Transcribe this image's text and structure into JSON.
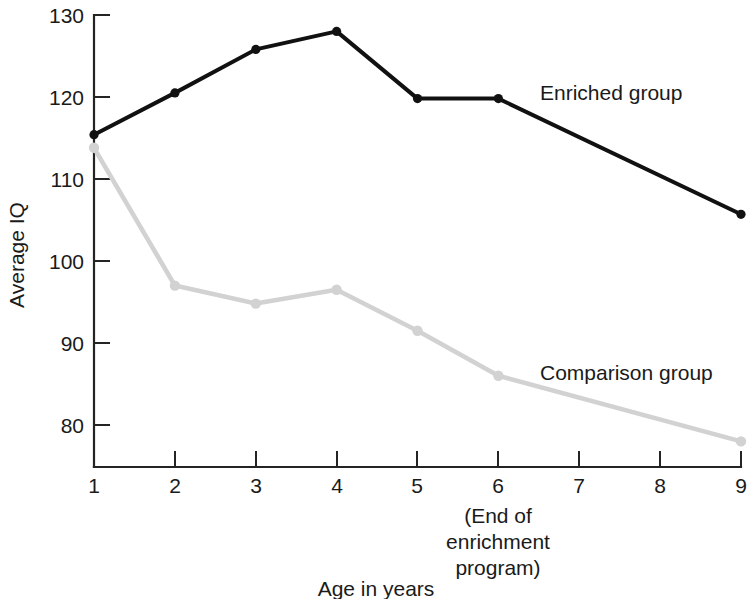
{
  "chart_data": {
    "type": "line",
    "title": "",
    "xlabel": "Age in years",
    "ylabel": "Average IQ",
    "xlim": [
      1,
      9
    ],
    "ylim": [
      75,
      130
    ],
    "grid": false,
    "legend_position": "inline-right",
    "x": [
      1,
      2,
      3,
      4,
      5,
      6,
      9
    ],
    "xticks": [
      "1",
      "2",
      "3",
      "4",
      "5",
      "6",
      "7",
      "8",
      "9"
    ],
    "yticks": [
      "80",
      "90",
      "100",
      "110",
      "120",
      "130"
    ],
    "series": [
      {
        "name": "Enriched group",
        "color": "#111111",
        "x": [
          1,
          2,
          3,
          4,
          5,
          6,
          9
        ],
        "values": [
          115.4,
          120.5,
          125.8,
          128.0,
          119.8,
          119.8,
          105.7
        ]
      },
      {
        "name": "Comparison group",
        "color": "#d2d2d2",
        "x": [
          1,
          2,
          3,
          4,
          5,
          6,
          9
        ],
        "values": [
          113.8,
          97.0,
          94.8,
          96.5,
          91.5,
          86.0,
          78.0
        ]
      }
    ],
    "annotations": [
      {
        "name": "end-of-enrichment-program",
        "at_x": 6,
        "lines": [
          "(End of",
          "enrichment",
          "program)"
        ]
      }
    ]
  },
  "labels": {
    "y_axis_title": "Average IQ",
    "x_axis_title": "Age in years",
    "series_enriched": "Enriched group",
    "series_comparison": "Comparison group",
    "annotation_line1": "(End of",
    "annotation_line2": "enrichment",
    "annotation_line3": "program)",
    "ytick_130": "130",
    "ytick_120": "120",
    "ytick_110": "110",
    "ytick_100": "100",
    "ytick_90": "90",
    "ytick_80": "80",
    "xtick_1": "1",
    "xtick_2": "2",
    "xtick_3": "3",
    "xtick_4": "4",
    "xtick_5": "5",
    "xtick_6": "6",
    "xtick_7": "7",
    "xtick_8": "8",
    "xtick_9": "9"
  }
}
